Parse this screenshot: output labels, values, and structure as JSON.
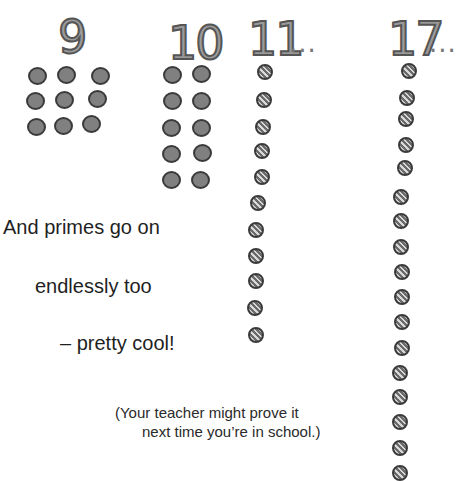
{
  "groups": [
    {
      "label": "9",
      "count": 9,
      "arrangement": "3x3 grid",
      "style": "solid",
      "ellipsis": false
    },
    {
      "label": "10",
      "count": 10,
      "arrangement": "2x5 grid",
      "style": "solid",
      "ellipsis": false
    },
    {
      "label": "11",
      "count": 11,
      "arrangement": "single column",
      "style": "hatched",
      "ellipsis": true
    },
    {
      "label": "17",
      "count": 17,
      "arrangement": "single column",
      "style": "hatched",
      "ellipsis": true
    }
  ],
  "ellipsis_text": "...",
  "text": {
    "line1": "And primes go on",
    "line2": "endlessly too",
    "line3": "– pretty cool!",
    "note_line1": "(Your teacher might prove it",
    "note_line2": "next time you’re in school.)"
  },
  "colors": {
    "solid_dot_fill": "#808080",
    "dot_outline": "#3a3a3a",
    "numeral_fill": "#9a9a9a",
    "text": "#1f1f1f"
  }
}
